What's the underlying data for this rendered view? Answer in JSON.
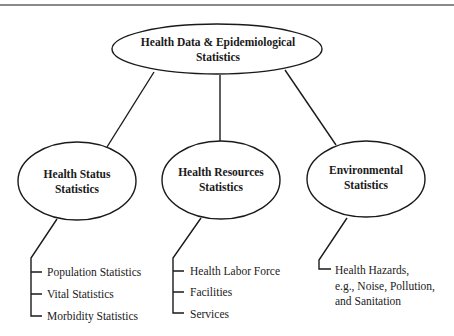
{
  "diagram": {
    "type": "hierarchy",
    "root": {
      "line1": "Health Data & Epidemiological",
      "line2": "Statistics"
    },
    "branches": [
      {
        "line1": "Health Status",
        "line2": "Statistics",
        "items": [
          "Population Statistics",
          "Vital Statistics",
          "Morbidity Statistics"
        ]
      },
      {
        "line1": "Health Resources",
        "line2": "Statistics",
        "items": [
          "Health Labor Force",
          "Facilities",
          "Services"
        ]
      },
      {
        "line1": "Environmental",
        "line2": "Statistics",
        "items_multiline": [
          "Health Hazards,",
          "e.g., Noise, Pollution,",
          "and Sanitation"
        ]
      }
    ],
    "colors": {
      "stroke": "#1a1a1a",
      "top_rule": "#8a8a8a",
      "background": "#ffffff"
    }
  }
}
